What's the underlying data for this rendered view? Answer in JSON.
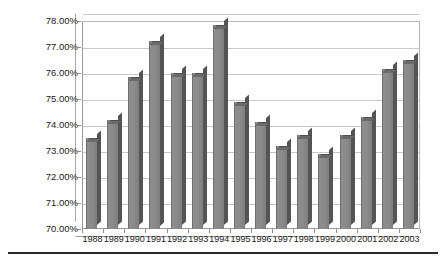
{
  "chart_data": {
    "type": "bar",
    "title": "",
    "subtitle": "",
    "xlabel": "",
    "ylabel": "",
    "categories": [
      "1988",
      "1989",
      "1990",
      "1991",
      "1992",
      "1993",
      "1994",
      "1995",
      "1996",
      "1997",
      "1998",
      "1999",
      "2000",
      "2001",
      "2002",
      "2003"
    ],
    "values": [
      73.5,
      74.2,
      75.85,
      77.25,
      76.0,
      76.0,
      77.85,
      74.9,
      74.1,
      73.2,
      73.6,
      72.9,
      73.6,
      74.3,
      76.15,
      76.5
    ],
    "value_labels": [
      "73.50%",
      "74.20%",
      "75.85%",
      "77.25%",
      "76.00%",
      "76.00%",
      "77.85%",
      "74.90%",
      "74.10%",
      "73.20%",
      "73.60%",
      "72.90%",
      "73.60%",
      "74.30%",
      "76.15%",
      "76.50%"
    ],
    "ylim": [
      70.0,
      78.0
    ],
    "ytick_values": [
      70.0,
      71.0,
      72.0,
      73.0,
      74.0,
      75.0,
      76.0,
      77.0,
      78.0
    ],
    "ytick_labels": [
      "70.00%",
      "71.00%",
      "72.00%",
      "73.00%",
      "74.00%",
      "75.00%",
      "76.00%",
      "77.00%",
      "78.00%"
    ],
    "grid": true,
    "grid_axis": "y",
    "legend": false,
    "legend_position": "none",
    "style": "3d-column",
    "series": [
      {
        "name": "",
        "values": [
          73.5,
          74.2,
          75.85,
          77.25,
          76.0,
          76.0,
          77.85,
          74.9,
          74.1,
          73.2,
          73.6,
          72.9,
          73.6,
          74.3,
          76.15,
          76.5
        ]
      }
    ],
    "colors": {
      "bar_face": "#8a8a8a",
      "bar_side": "#545454",
      "bar_top": "#6a6a6a",
      "gridline": "#c9c9c9",
      "axis": "#8f8f8f",
      "text": "#1a1a1a",
      "background": "#ffffff",
      "rule": "#2b2b2b"
    }
  }
}
